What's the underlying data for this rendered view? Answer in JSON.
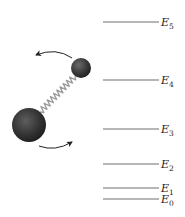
{
  "figure": {
    "molecule": {
      "small_atom": {
        "cx": 81,
        "cy": 68,
        "r": 10,
        "color": "#3a3a3a"
      },
      "large_atom": {
        "cx": 29,
        "cy": 125,
        "r": 17,
        "color": "#343434"
      },
      "spring": {
        "x1": 40,
        "y1": 112,
        "x2": 75,
        "y2": 76,
        "coils": 11,
        "color": "#9a9a9a"
      },
      "rotation_arrows": [
        {
          "name": "top-arrow",
          "path": "M72,58 Q56,47 36,55",
          "tip": [
            36,
            55
          ]
        },
        {
          "name": "bottom-arrow",
          "path": "M39,146 Q55,152 72,142",
          "tip": [
            72,
            142
          ]
        }
      ]
    },
    "energy_levels": {
      "line_x1": 103,
      "line_x2": 159,
      "label_x": 161,
      "color": "#6e6e6e",
      "levels": [
        {
          "symbol": "E",
          "subscript": "5",
          "y": 22
        },
        {
          "symbol": "E",
          "subscript": "4",
          "y": 80
        },
        {
          "symbol": "E",
          "subscript": "3",
          "y": 129
        },
        {
          "symbol": "E",
          "subscript": "2",
          "y": 164
        },
        {
          "symbol": "E",
          "subscript": "1",
          "y": 188
        },
        {
          "symbol": "E",
          "subscript": "0",
          "y": 199
        }
      ]
    }
  }
}
